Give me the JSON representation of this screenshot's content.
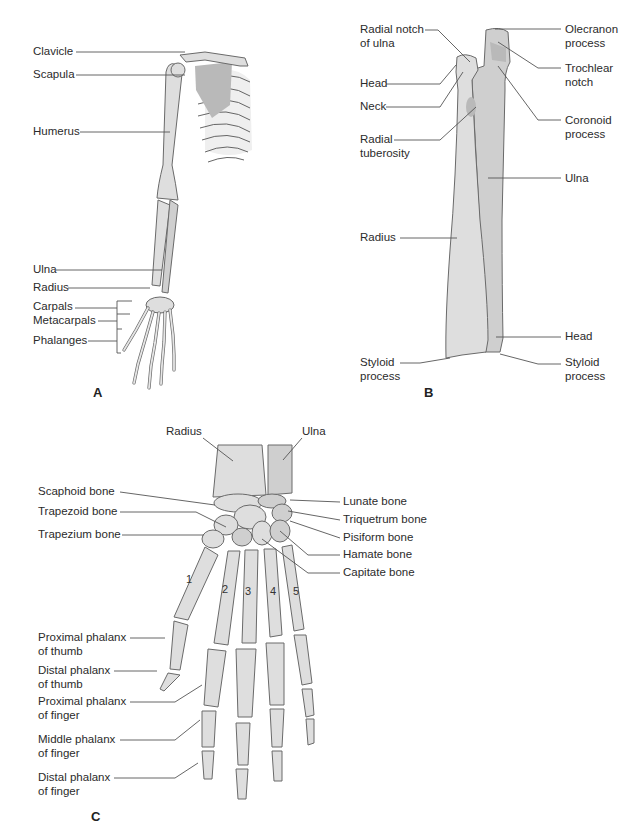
{
  "figure": {
    "panels": [
      {
        "id": "A",
        "label": "A",
        "subject": "Right upper limb skeleton",
        "callouts": [
          {
            "text": [
              "Clavicle"
            ]
          },
          {
            "text": [
              "Scapula"
            ]
          },
          {
            "text": [
              "Humerus"
            ]
          },
          {
            "text": [
              "Ulna"
            ]
          },
          {
            "text": [
              "Radius"
            ]
          },
          {
            "text": [
              "Carpals"
            ]
          },
          {
            "text": [
              "Metacarpals"
            ]
          },
          {
            "text": [
              "Phalanges"
            ]
          }
        ]
      },
      {
        "id": "B",
        "label": "B",
        "subject": "Radius and ulna",
        "callouts_left": [
          {
            "text": [
              "Radial notch",
              "of ulna"
            ]
          },
          {
            "text": [
              "Head"
            ]
          },
          {
            "text": [
              "Neck"
            ]
          },
          {
            "text": [
              "Radial",
              "tuberosity"
            ]
          },
          {
            "text": [
              "Radius"
            ]
          },
          {
            "text": [
              "Styloid",
              "process"
            ]
          }
        ],
        "callouts_right": [
          {
            "text": [
              "Olecranon",
              "process"
            ]
          },
          {
            "text": [
              "Trochlear",
              "notch"
            ]
          },
          {
            "text": [
              "Coronoid",
              "process"
            ]
          },
          {
            "text": [
              "Ulna"
            ]
          },
          {
            "text": [
              "Head"
            ]
          },
          {
            "text": [
              "Styloid",
              "process"
            ]
          }
        ]
      },
      {
        "id": "C",
        "label": "C",
        "subject": "Bones of the wrist and hand",
        "callouts_top": [
          {
            "text": [
              "Radius"
            ]
          },
          {
            "text": [
              "Ulna"
            ]
          }
        ],
        "callouts_left": [
          {
            "text": [
              "Scaphoid bone"
            ]
          },
          {
            "text": [
              "Trapezoid bone"
            ]
          },
          {
            "text": [
              "Trapezium bone"
            ]
          },
          {
            "text": [
              "Proximal phalanx",
              "of thumb"
            ]
          },
          {
            "text": [
              "Distal phalanx",
              "of thumb"
            ]
          },
          {
            "text": [
              "Proximal phalanx",
              "of finger"
            ]
          },
          {
            "text": [
              "Middle phalanx",
              "of finger"
            ]
          },
          {
            "text": [
              "Distal phalanx",
              "of finger"
            ]
          }
        ],
        "callouts_right": [
          {
            "text": [
              "Lunate bone"
            ]
          },
          {
            "text": [
              "Triquetrum bone"
            ]
          },
          {
            "text": [
              "Pisiform bone"
            ]
          },
          {
            "text": [
              "Hamate bone"
            ]
          },
          {
            "text": [
              "Capitate bone"
            ]
          }
        ],
        "metacarpal_numbers": [
          "1",
          "2",
          "3",
          "4",
          "5"
        ]
      }
    ],
    "colors": {
      "bone_fill": "#dedede",
      "bone_shade": "#b9b9b9",
      "outline": "#6a6a6a",
      "leader_line": "#555555",
      "text": "#2b2b2b"
    }
  }
}
